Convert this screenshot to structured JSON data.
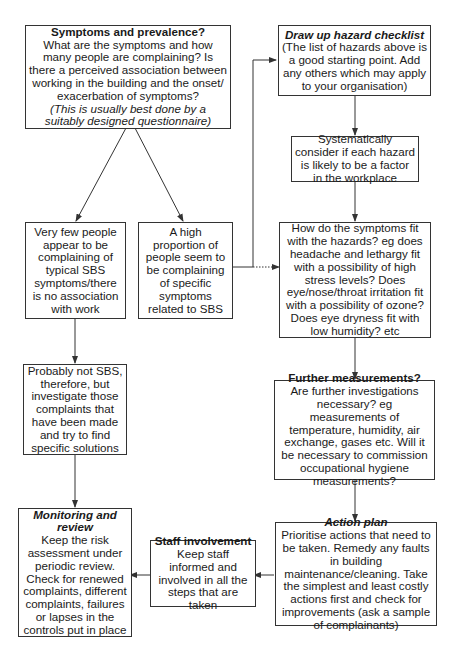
{
  "diagram": {
    "type": "flowchart",
    "nodes": {
      "symptoms": {
        "title": "Symptoms and prevalence?",
        "body": "What are the symptoms and how many people are complaining? Is there a perceived association between working in the building and the onset/ exacerbation of symptoms?",
        "note": "(This is usually best done by a suitably designed questionnaire)"
      },
      "few_people": {
        "body": "Very few people appear to be complaining of typical SBS symptoms/there is no association with work"
      },
      "high_proportion": {
        "body": "A high proportion of people seem to be complaining of specific symptoms related to SBS"
      },
      "hazard_checklist": {
        "title": "Draw up hazard checklist",
        "body": "(The list of hazards above is a good starting point. Add any others which may apply to your organisation)"
      },
      "consider": {
        "body": "Systematically consider if each hazard is likely to be a factor in the workplace"
      },
      "symptoms_fit": {
        "body": "How do the symptoms fit with the hazards? eg does headache and lethargy fit with a possibility of high stress levels? Does eye/nose/throat irritation fit with a possibility of ozone? Does eye dryness fit with low humidity? etc"
      },
      "probably_not": {
        "body": "Probably not SBS, therefore, but investigate those complaints that have been made and try to find specific solutions"
      },
      "further": {
        "title": "Further measurements?",
        "body": "Are further investigations necessary? eg measurements of temperature, humidity, air exchange, gases etc. Will it be necessary to commission occupational hygiene measurements?"
      },
      "monitoring": {
        "title": "Monitoring and review",
        "body": "Keep the risk assessment under periodic review. Check for renewed complaints, different complaints, failures or lapses in the controls put in place"
      },
      "staff": {
        "title": "Staff involvement",
        "body": "Keep staff informed and involved in all the steps that are taken"
      },
      "action": {
        "title": "Action plan",
        "body": "Prioritise actions that need to be taken. Remedy any faults in building maintenance/cleaning. Take the simplest and least costly actions first and check for improvements (ask a sample of complainants)"
      }
    },
    "edges": [
      {
        "from": "symptoms",
        "to": "few_people"
      },
      {
        "from": "symptoms",
        "to": "high_proportion"
      },
      {
        "from": "high_proportion",
        "to": "hazard_checklist"
      },
      {
        "from": "high_proportion",
        "to": "symptoms_fit",
        "style": "dotted"
      },
      {
        "from": "hazard_checklist",
        "to": "consider"
      },
      {
        "from": "consider",
        "to": "symptoms_fit"
      },
      {
        "from": "symptoms_fit",
        "to": "further"
      },
      {
        "from": "few_people",
        "to": "probably_not"
      },
      {
        "from": "probably_not",
        "to": "monitoring"
      },
      {
        "from": "further",
        "to": "action"
      },
      {
        "from": "action",
        "to": "staff"
      },
      {
        "from": "staff",
        "to": "monitoring"
      }
    ],
    "colors": {
      "line": "#333333",
      "background": "#ffffff",
      "text": "#1a1a1a"
    }
  }
}
